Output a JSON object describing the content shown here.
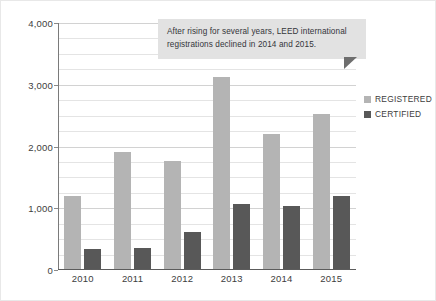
{
  "chart_data": {
    "type": "bar",
    "title": "",
    "subtitle": "",
    "xlabel": "",
    "ylabel": "",
    "categories": [
      "2010",
      "2011",
      "2012",
      "2013",
      "2014",
      "2015"
    ],
    "series": [
      {
        "name": "REGISTERED",
        "color": "#b4b4b4",
        "values": [
          1200,
          1910,
          1770,
          3130,
          2200,
          2530
        ]
      },
      {
        "name": "CERTIFIED",
        "color": "#585858",
        "values": [
          340,
          360,
          610,
          1070,
          1040,
          1200
        ]
      }
    ],
    "ylim": [
      0,
      4000
    ],
    "y_ticks": [
      0,
      1000,
      2000,
      3000,
      4000
    ],
    "y_tick_labels": [
      "0",
      "1,000",
      "2,000",
      "3,000",
      "4,000"
    ],
    "y_minor_step": 250,
    "grid": true,
    "legend_position": "right",
    "annotations": [
      {
        "text": "After rising for several years, LEED international registrations declined in 2014 and 2015.",
        "background": "#e2e2e2"
      }
    ]
  },
  "legend": {
    "items": [
      {
        "label": "REGISTERED",
        "swatch": "registered"
      },
      {
        "label": "CERTIFIED",
        "swatch": "certified"
      }
    ]
  },
  "annotation": {
    "text": "After rising for several years, LEED international registrations declined in 2014 and 2015."
  }
}
